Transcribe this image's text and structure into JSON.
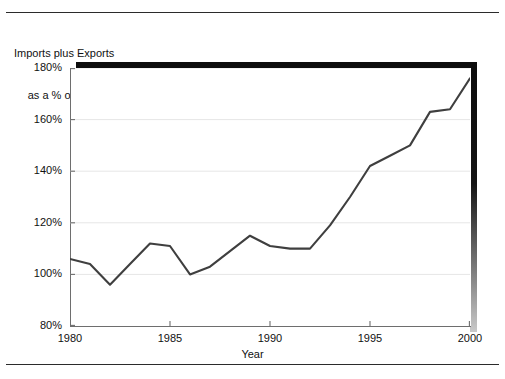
{
  "chart_data": {
    "type": "line",
    "title": "Imports plus Exports as a % of GDP",
    "title_line1": "Imports plus Exports",
    "title_line2": "as a % of GDP",
    "xlabel": "Year",
    "ylabel": "",
    "xlim": [
      1980,
      2000
    ],
    "ylim": [
      80,
      180
    ],
    "grid": "horizontal",
    "legend": "none",
    "line_color": "#3f3f3f",
    "x_ticks": [
      1980,
      1985,
      1990,
      1995,
      2000
    ],
    "x_tick_labels": [
      "1980",
      "1985",
      "1990",
      "1995",
      "2000"
    ],
    "y_ticks": [
      80,
      100,
      120,
      140,
      160,
      180
    ],
    "y_tick_labels": [
      "80%",
      "100%",
      "120%",
      "140%",
      "160%",
      "180%"
    ],
    "x": [
      1980,
      1981,
      1982,
      1983,
      1984,
      1985,
      1986,
      1987,
      1988,
      1989,
      1990,
      1991,
      1992,
      1993,
      1994,
      1995,
      1996,
      1997,
      1998,
      1999,
      2000
    ],
    "values": [
      106,
      104,
      96,
      104,
      112,
      111,
      100,
      103,
      109,
      115,
      111,
      110,
      110,
      119,
      130,
      142,
      146,
      150,
      163,
      164,
      176
    ],
    "series": [
      {
        "name": "Imports plus Exports as a % of GDP",
        "values": [
          106,
          104,
          96,
          104,
          112,
          111,
          100,
          103,
          109,
          115,
          111,
          110,
          110,
          119,
          130,
          142,
          146,
          150,
          163,
          164,
          176
        ]
      }
    ]
  },
  "figure": {
    "background": "#ffffff",
    "rule_color": "#2b2b2b"
  }
}
